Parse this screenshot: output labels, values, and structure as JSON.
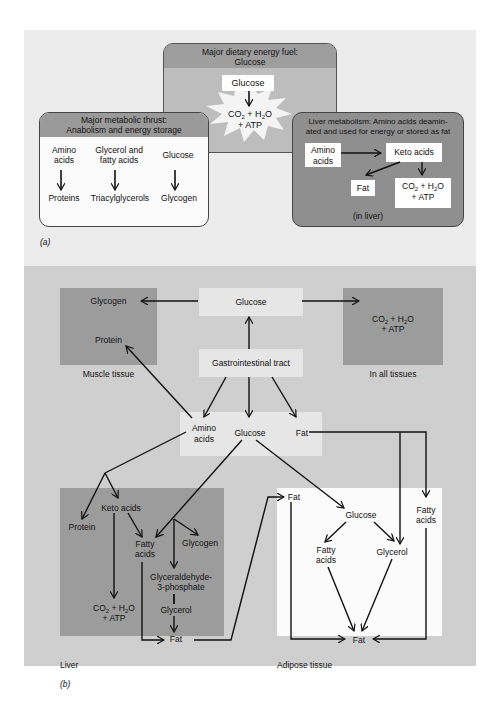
{
  "panel_a": {
    "label": "(a)",
    "center_box": {
      "title_line1": "Major dietary energy fuel:",
      "title_line2": "Glucose",
      "input": "Glucose",
      "output_line1_pre": "CO",
      "output_line1_sub1": "2",
      "output_line1_mid": " + H",
      "output_line1_sub2": "2",
      "output_line1_post": "O",
      "output_line2": "+ ATP"
    },
    "left_box": {
      "title_line1": "Major metabolic thrust:",
      "title_line2": "Anabolism and energy storage",
      "columns": [
        {
          "from_line1": "Amino",
          "from_line2": "acids",
          "to": "Proteins"
        },
        {
          "from_line1": "Glycerol and",
          "from_line2": "fatty acids",
          "to": "Triacylglycerols"
        },
        {
          "from_line1": "Glucose",
          "from_line2": "",
          "to": "Glycogen"
        }
      ]
    },
    "right_box": {
      "title_line1": "Liver metabolism:  Amino acids deamin-",
      "title_line2": "ated and used for energy or stored as fat",
      "amino_line1": "Amino",
      "amino_line2": "acids",
      "keto": "Keto acids",
      "fat": "Fat",
      "co2_line2": "+ ATP",
      "footer": "(in liver)"
    }
  },
  "panel_b": {
    "label": "(b)",
    "glucose_top": "Glucose",
    "gi_tract": "Gastrointestinal tract",
    "muscle": {
      "glycogen": "Glycogen",
      "protein": "Protein",
      "caption": "Muscle tissue"
    },
    "all_tissues": {
      "line2": "+ ATP",
      "caption": "In all tissues"
    },
    "absorbed": {
      "amino_line1": "Amino",
      "amino_line2": "acids",
      "glucose": "Glucose",
      "fat": "Fat"
    },
    "liver": {
      "protein": "Protein",
      "keto": "Keto acids",
      "fatty_line1": "Fatty",
      "fatty_line2": "acids",
      "glycogen": "Glycogen",
      "g3p_line1": "Glyceraldehyde-",
      "g3p_line2": "3-phosphate",
      "glycerol": "Glycerol",
      "fat": "Fat",
      "co2_line2": "+ ATP",
      "caption": "Liver"
    },
    "adipose": {
      "fat_in": "Fat",
      "glucose": "Glucose",
      "fatty_line1": "Fatty",
      "fatty_line2": "acids",
      "glycerol": "Glycerol",
      "fatty_right_line1": "Fatty",
      "fatty_right_line2": "acids",
      "fat_out": "Fat",
      "caption": "Adipose tissue"
    }
  }
}
